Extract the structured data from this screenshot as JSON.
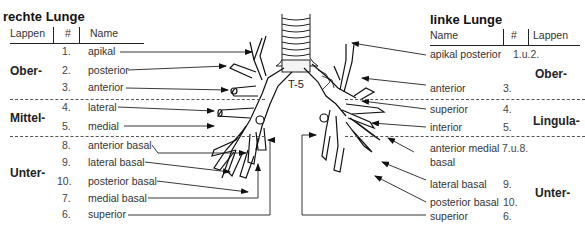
{
  "right_lung": {
    "title": "rechte Lunge",
    "headers": {
      "lobe": "Lappen",
      "num": "#",
      "name": "Name"
    },
    "lobes": {
      "upper": "Ober-",
      "middle": "Mittel-",
      "lower": "Unter-"
    },
    "segments": [
      {
        "num": "1.",
        "name": "apikal"
      },
      {
        "num": "2.",
        "name": "posterior"
      },
      {
        "num": "3.",
        "name": "anterior"
      },
      {
        "num": "4.",
        "name": "lateral"
      },
      {
        "num": "5.",
        "name": "medial"
      },
      {
        "num": "8.",
        "name": "anterior basal"
      },
      {
        "num": "9.",
        "name": "lateral basal"
      },
      {
        "num": "10.",
        "name": "posterior basal"
      },
      {
        "num": "7.",
        "name": "medial basal"
      },
      {
        "num": "6.",
        "name": "superior"
      }
    ]
  },
  "left_lung": {
    "title": "linke Lunge",
    "headers": {
      "name": "Name",
      "num": "#",
      "lobe": "Lappen"
    },
    "lobes": {
      "upper": "Ober-",
      "lingula": "Lingula-",
      "lower": "Unter-"
    },
    "segments": [
      {
        "name": "apikal posterior",
        "num": "1.u.2."
      },
      {
        "name": "anterior",
        "num": "3."
      },
      {
        "name": "superior",
        "num": "4."
      },
      {
        "name": "interior",
        "num": "5."
      },
      {
        "name": "anterior medial",
        "name2": "basal",
        "num": "7.u.8."
      },
      {
        "name": "lateral basal",
        "num": "9."
      },
      {
        "name": "posterior basal",
        "num": "10."
      },
      {
        "name": "superior",
        "num": "6."
      }
    ]
  },
  "diagram": {
    "vertebra_label": "T-5"
  }
}
